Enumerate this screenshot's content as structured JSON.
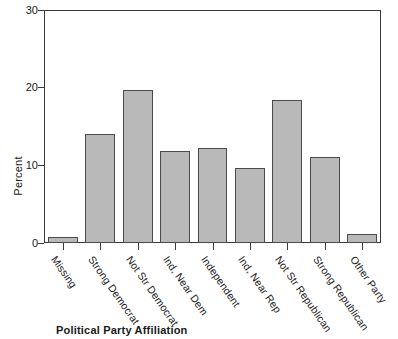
{
  "chart_data": {
    "type": "bar",
    "title": "",
    "xlabel": "Political Party Affiliation",
    "ylabel": "Percent",
    "ylim": [
      0,
      30
    ],
    "yticks": [
      0,
      10,
      20,
      30
    ],
    "grid": false,
    "legend": "none",
    "categories": [
      "Missing",
      "Strong Democrat",
      "Not Str Democrat",
      "Ind, Near Dem",
      "Independent",
      "Ind, Near Rep",
      "Not Str Republican",
      "Strong Republican",
      "Other Party"
    ],
    "values": [
      0.8,
      14.0,
      19.7,
      11.8,
      12.2,
      9.7,
      18.4,
      11.1,
      1.1
    ],
    "bar_fill_color": "#b9b9b9",
    "bar_border_color": "#4a4a4a",
    "axis_color": "#3a3a3a"
  },
  "axes": {
    "y_tick_labels": [
      "30",
      "20",
      "10",
      "0"
    ],
    "y_title": "Percent",
    "x_title": "Political Party Affiliation"
  }
}
